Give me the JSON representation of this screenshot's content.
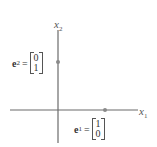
{
  "diagram": {
    "axes": {
      "x_label_var": "x",
      "x_label_sub": "1",
      "y_label_var": "x",
      "y_label_sub": "2"
    },
    "vectors": [
      {
        "name": "e",
        "sub": "2",
        "equals": "=",
        "components": [
          "0",
          "1"
        ],
        "point": [
          0,
          1
        ]
      },
      {
        "name": "e",
        "sub": "1",
        "equals": "=",
        "components": [
          "1",
          "0"
        ],
        "point": [
          1,
          0
        ]
      }
    ]
  }
}
